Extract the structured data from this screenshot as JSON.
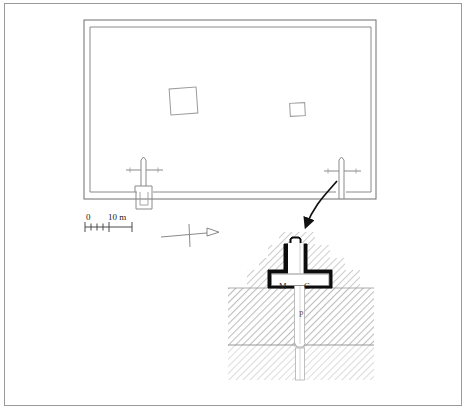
{
  "figure": {
    "kind": "archaeological-site-plan-with-section",
    "width": 468,
    "height": 411,
    "frame_color": "#9a9a9a",
    "background_color": "#ffffff"
  },
  "plan": {
    "name": "walled-enclosure-plan",
    "description": "Rectangular double-line enclosure wall with two interior structures and two gates on the south wall",
    "outer_rect": {
      "x": 84,
      "y": 20,
      "width": 292,
      "height": 179
    },
    "inner_rect": {
      "x": 90,
      "y": 27,
      "width": 281,
      "height": 165
    },
    "wall_color": "#6e6e6e",
    "structures": [
      {
        "name": "large-interior-structure",
        "x": 170,
        "y": 88,
        "width": 27,
        "height": 26,
        "rotation": -4
      },
      {
        "name": "small-interior-structure",
        "x": 290,
        "y": 103,
        "width": 15,
        "height": 13,
        "rotation": -3
      }
    ],
    "gates": [
      {
        "name": "west-gate",
        "x": 143,
        "y": 178,
        "has_outer_projection": true
      },
      {
        "name": "east-gate",
        "x": 341,
        "y": 178,
        "has_outer_projection": false
      }
    ]
  },
  "scale_bar": {
    "name": "scale-bar",
    "zero_label": "0",
    "max_label": "10 m",
    "x": 85,
    "y": 224,
    "length": 47,
    "tick_count": 5
  },
  "north_arrow": {
    "name": "north-arrow",
    "direction": "right",
    "x": 175,
    "y": 232
  },
  "leader_arrow": {
    "name": "detail-leader-arrow",
    "from": {
      "x": 337,
      "y": 180
    },
    "to": {
      "x": 305,
      "y": 228
    },
    "color": "#111111"
  },
  "section": {
    "name": "gate-cross-section-detail",
    "title": "",
    "bounds": {
      "x": 228,
      "y": 232,
      "width": 146,
      "height": 148
    },
    "ground_level_y": 288,
    "lower_stratum_y": 345,
    "masonry_color": "#0d0d0d",
    "fill_color": "#d8d8d8",
    "labels": [
      {
        "name": "section-label-m",
        "text": "M",
        "meaning": "masonry",
        "x": 279,
        "y": 282
      },
      {
        "name": "section-label-c",
        "text": "C",
        "meaning": "chamber",
        "x": 304,
        "y": 282
      },
      {
        "name": "section-label-p",
        "text": "P",
        "meaning": "pit-shaft",
        "x": 299,
        "y": 311
      }
    ]
  }
}
